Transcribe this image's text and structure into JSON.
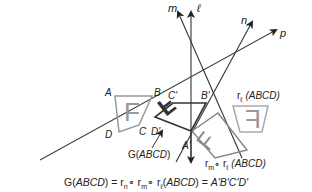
{
  "lines": {
    "m": "m",
    "l": "ℓ",
    "n": "n",
    "p": "p"
  },
  "vertices": {
    "original": [
      "A",
      "B",
      "C",
      "D"
    ],
    "image": [
      "A'",
      "B'",
      "C'",
      "D'"
    ]
  },
  "letter": "F",
  "labels": {
    "r_l": "r",
    "r_l_sub": "ℓ",
    "r_l_arg": " (ABCD)",
    "r_m": "r",
    "r_m_sub": "m",
    "comp": "∘",
    "r_l2": " r",
    "r_l2_sub": "ℓ",
    "r_ml_arg": " (ABCD)",
    "g": "G(",
    "g_arg": "ABCD",
    "g_close": ")"
  },
  "formula": {
    "lhs_g": "G(",
    "lhs_arg": "ABCD",
    "lhs_close": ") = r",
    "sub_n": "n",
    "comp1": "∘ r",
    "sub_m": "m",
    "comp2": "∘ r",
    "sub_l": "ℓ",
    "paren_open": "(",
    "arg": "ABCD",
    "rhs": ") = ",
    "result": "A'B'C'D'"
  },
  "colors": {
    "line": "#333333",
    "shape_light": "#999999",
    "shape_dark": "#333333",
    "text": "#222222"
  }
}
